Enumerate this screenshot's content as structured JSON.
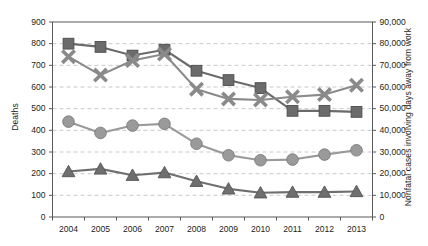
{
  "chart_data": {
    "type": "line",
    "title": "",
    "xlabel": "",
    "ylabel": "Deaths",
    "y2label": "Nonfatal cases involving days away from work",
    "categories": [
      "2004",
      "2005",
      "2006",
      "2007",
      "2008",
      "2009",
      "2010",
      "2011",
      "2012",
      "2013"
    ],
    "x": [
      2004,
      2005,
      2006,
      2007,
      2008,
      2009,
      2010,
      2011,
      2012,
      2013
    ],
    "ylim": [
      0,
      900
    ],
    "y2lim": [
      0,
      90000
    ],
    "yticks": [
      "0",
      "100",
      "200",
      "300",
      "400",
      "500",
      "600",
      "700",
      "800",
      "900"
    ],
    "y2ticks": [
      "0",
      "10,000",
      "20,000",
      "30,000",
      "40,000",
      "50,000",
      "60,000",
      "70,000",
      "80,000",
      "90,000"
    ],
    "grid": true,
    "grid_style": "dashed-horizontal",
    "legend": "none",
    "series": [
      {
        "name": "series-square",
        "marker": "square",
        "axis": "left",
        "color": "#6b6b6b",
        "values": [
          800,
          785,
          745,
          772,
          675,
          632,
          595,
          490,
          490,
          485
        ]
      },
      {
        "name": "series-x",
        "marker": "x",
        "axis": "left",
        "color": "#8a8a8a",
        "values": [
          740,
          655,
          722,
          752,
          590,
          545,
          540,
          555,
          565,
          608
        ]
      },
      {
        "name": "series-circle",
        "marker": "circle",
        "axis": "left",
        "color": "#9a9a9a",
        "values": [
          440,
          388,
          422,
          430,
          338,
          285,
          262,
          265,
          288,
          308
        ]
      },
      {
        "name": "series-triangle",
        "marker": "triangle",
        "axis": "left",
        "color": "#6f6f6f",
        "values": [
          210,
          222,
          193,
          205,
          165,
          130,
          112,
          115,
          115,
          118
        ]
      }
    ]
  },
  "axes": {
    "left_title": "Deaths",
    "right_title": "Nonfatal cases involving days away from work"
  },
  "colors": {
    "square": "#6b6b6b",
    "x": "#8a8a8a",
    "circle": "#9a9a9a",
    "triangle": "#6f6f6f",
    "axis": "#58595b",
    "grid": "#b9bcbe",
    "text": "#231f20"
  }
}
